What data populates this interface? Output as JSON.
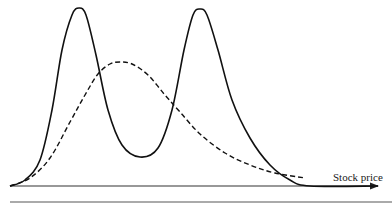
{
  "chart_data": {
    "type": "line",
    "title": "",
    "xlabel": "Stock price",
    "ylabel": "",
    "grid": false,
    "legend": null,
    "series": [
      {
        "name": "bimodal distribution",
        "style": "solid",
        "color": "#111111",
        "points": [
          [
            10,
            186
          ],
          [
            25,
            180
          ],
          [
            40,
            160
          ],
          [
            52,
            110
          ],
          [
            62,
            50
          ],
          [
            72,
            15
          ],
          [
            79,
            8
          ],
          [
            86,
            15
          ],
          [
            96,
            55
          ],
          [
            108,
            110
          ],
          [
            122,
            145
          ],
          [
            140,
            157
          ],
          [
            158,
            148
          ],
          [
            172,
            110
          ],
          [
            184,
            50
          ],
          [
            193,
            15
          ],
          [
            200,
            9
          ],
          [
            207,
            15
          ],
          [
            218,
            50
          ],
          [
            232,
            100
          ],
          [
            250,
            138
          ],
          [
            270,
            165
          ],
          [
            290,
            180
          ],
          [
            310,
            186
          ],
          [
            378,
            186
          ]
        ]
      },
      {
        "name": "lognormal distribution",
        "style": "dashed",
        "color": "#111111",
        "points": [
          [
            10,
            186
          ],
          [
            30,
            178
          ],
          [
            50,
            158
          ],
          [
            70,
            122
          ],
          [
            85,
            95
          ],
          [
            98,
            74
          ],
          [
            110,
            64
          ],
          [
            120,
            62
          ],
          [
            132,
            64
          ],
          [
            148,
            75
          ],
          [
            165,
            95
          ],
          [
            180,
            112
          ],
          [
            200,
            134
          ],
          [
            225,
            153
          ],
          [
            250,
            165
          ],
          [
            275,
            173
          ],
          [
            305,
            178
          ]
        ]
      }
    ],
    "axis": {
      "x_start": 10,
      "x_end": 378,
      "y": 186
    }
  },
  "labels": {
    "x_axis": "Stock price"
  }
}
